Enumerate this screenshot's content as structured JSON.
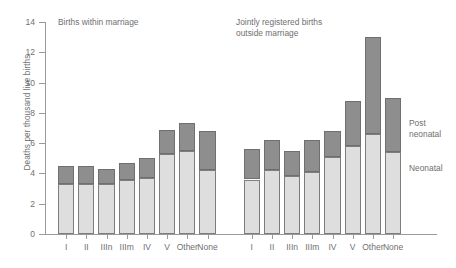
{
  "axis": {
    "y_title": "Deaths per thousand live births",
    "y_ticks": [
      "0",
      "2",
      "4",
      "6",
      "8",
      "10",
      "12",
      "14"
    ]
  },
  "groups": [
    {
      "title": "Births within marriage"
    },
    {
      "title": "Jointly registered births\noutside marriage"
    }
  ],
  "legend": {
    "post_neonatal": "Post\nneonatal",
    "neonatal": "Neonatal",
    "post_neonatal_color": "#8e8e8e",
    "neonatal_color": "#dedede"
  },
  "chart_data": {
    "type": "bar",
    "title": "",
    "xlabel": "",
    "ylabel": "Deaths per thousand live births",
    "ylim": [
      0,
      14
    ],
    "ytick_step": 2,
    "grid": false,
    "stacked": true,
    "legend_position": "right",
    "group_labels": [
      "Births within marriage",
      "Jointly registered births outside marriage"
    ],
    "categories": [
      "I",
      "II",
      "IIIn",
      "IIIm",
      "IV",
      "V",
      "Other",
      "None"
    ],
    "series": [
      {
        "name": "Neonatal",
        "color": "#dedede",
        "groups": [
          {
            "group": "Births within marriage",
            "values": [
              3.3,
              3.3,
              3.3,
              3.6,
              3.7,
              5.3,
              5.5,
              4.2
            ]
          },
          {
            "group": "Jointly registered births outside marriage",
            "values": [
              3.6,
              4.2,
              3.8,
              4.1,
              5.1,
              5.8,
              6.6,
              5.4
            ]
          }
        ]
      },
      {
        "name": "Post neonatal",
        "color": "#8e8e8e",
        "groups": [
          {
            "group": "Births within marriage",
            "values": [
              1.2,
              1.2,
              1.0,
              1.1,
              1.3,
              1.6,
              1.8,
              2.6
            ]
          },
          {
            "group": "Jointly registered births outside marriage",
            "values": [
              2.0,
              2.0,
              1.7,
              2.1,
              1.7,
              3.0,
              6.4,
              3.6
            ]
          }
        ]
      }
    ],
    "totals": {
      "Births within marriage": [
        4.5,
        4.5,
        4.3,
        4.7,
        5.0,
        6.9,
        7.3,
        6.8
      ],
      "Jointly registered births outside marriage": [
        5.6,
        6.2,
        5.5,
        6.2,
        6.8,
        8.8,
        13.0,
        9.0
      ]
    }
  }
}
